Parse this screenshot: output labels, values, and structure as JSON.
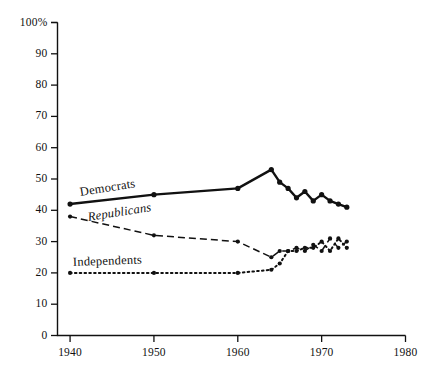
{
  "chart_data": {
    "type": "line",
    "title": "",
    "subtitle": "",
    "xlabel": "",
    "ylabel": "",
    "xlim": [
      1938.5,
      1980
    ],
    "ylim": [
      0,
      100
    ],
    "grid": false,
    "legend_position": "inline-annotations",
    "y_ticks": [
      0,
      10,
      20,
      30,
      40,
      50,
      60,
      70,
      80,
      90,
      100
    ],
    "y_tick_labels": [
      "0",
      "10",
      "20",
      "30",
      "40",
      "50",
      "60",
      "70",
      "80",
      "90",
      "100%"
    ],
    "x_ticks": [
      1940,
      1950,
      1960,
      1970,
      1980
    ],
    "x_tick_labels": [
      "1940",
      "1950",
      "1960",
      "1970",
      "1980"
    ],
    "series": [
      {
        "name": "Democrats",
        "style": "solid",
        "marker": "filled-circle",
        "color": "#111111",
        "x": [
          1940,
          1950,
          1960,
          1964,
          1965,
          1966,
          1967,
          1968,
          1969,
          1970,
          1971,
          1972,
          1973
        ],
        "values": [
          42,
          45,
          47,
          53,
          49,
          47,
          44,
          46,
          43,
          45,
          43,
          42,
          41
        ]
      },
      {
        "name": "Republicans",
        "style": "dashed",
        "marker": "filled-circle",
        "color": "#111111",
        "x": [
          1940,
          1950,
          1960,
          1964,
          1965,
          1966,
          1967,
          1968,
          1969,
          1970,
          1971,
          1972,
          1973
        ],
        "values": [
          38,
          32,
          30,
          25,
          27,
          27,
          28,
          27,
          29,
          27,
          31,
          28,
          30
        ]
      },
      {
        "name": "Independents",
        "style": "dotted",
        "marker": "filled-circle",
        "color": "#111111",
        "x": [
          1940,
          1950,
          1960,
          1964,
          1965,
          1966,
          1967,
          1968,
          1969,
          1970,
          1971,
          1972,
          1973
        ],
        "values": [
          20,
          20,
          20,
          21,
          23,
          27,
          27,
          28,
          28,
          30,
          27,
          31,
          28
        ]
      }
    ],
    "annotations": [
      {
        "text": "Democrats",
        "series": "Democrats"
      },
      {
        "text": "Republicans",
        "series": "Republicans"
      },
      {
        "text": "Independents",
        "series": "Independents"
      }
    ]
  },
  "axis": {
    "y_labels": [
      "100%",
      "90",
      "80",
      "70",
      "60",
      "50",
      "40",
      "30",
      "20",
      "10",
      "0"
    ],
    "x_labels": [
      "1940",
      "1950",
      "1960",
      "1970",
      "1980"
    ]
  },
  "labels": {
    "democrats": "Democrats",
    "republicans": "Republicans",
    "independents": "Independents"
  }
}
